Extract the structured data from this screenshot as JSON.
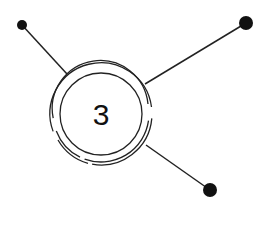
{
  "diagram": {
    "type": "hub-and-spoke",
    "colors": {
      "background": "#ffffff",
      "stroke": "#222222",
      "dot": "#111111"
    },
    "hub": {
      "label": "3",
      "cx": 101,
      "cy": 114,
      "inner_radius": 41
    },
    "spokes": [
      {
        "name": "top-left",
        "dot": {
          "cx": 22,
          "cy": 25,
          "r": 5
        },
        "line_end": {
          "x": 67,
          "y": 74
        }
      },
      {
        "name": "top-right",
        "dot": {
          "cx": 246,
          "cy": 23,
          "r": 7
        },
        "line_end": {
          "x": 145,
          "y": 84
        }
      },
      {
        "name": "bottom-right",
        "dot": {
          "cx": 210,
          "cy": 190,
          "r": 7
        },
        "line_end": {
          "x": 146,
          "y": 145
        }
      }
    ]
  }
}
